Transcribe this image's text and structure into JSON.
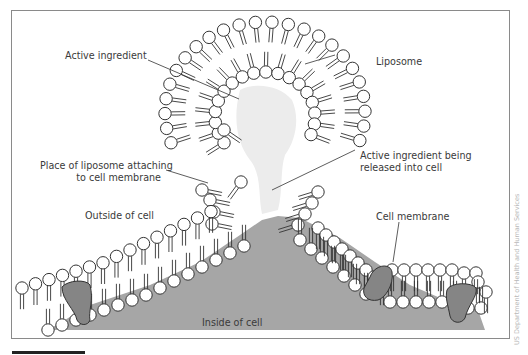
{
  "diagram": {
    "labels": {
      "active_ingredient": "Active ingredient",
      "liposome": "Liposome",
      "attach_line1": "Place of liposome attaching",
      "attach_line2": "to cell membrane",
      "released_line1": "Active ingredient being",
      "released_line2": "released into cell",
      "outside": "Outside of cell",
      "cell_membrane": "Cell membrane",
      "inside": "Inside of cell"
    },
    "credit": "US Department of Health and Human Services",
    "colors": {
      "frame": "#8a8a8a",
      "cell_interior": "#a6a6a6",
      "protein": "#858585",
      "active_ingredient": "#ececec",
      "stroke": "#333333",
      "text": "#3a3a3a"
    }
  }
}
